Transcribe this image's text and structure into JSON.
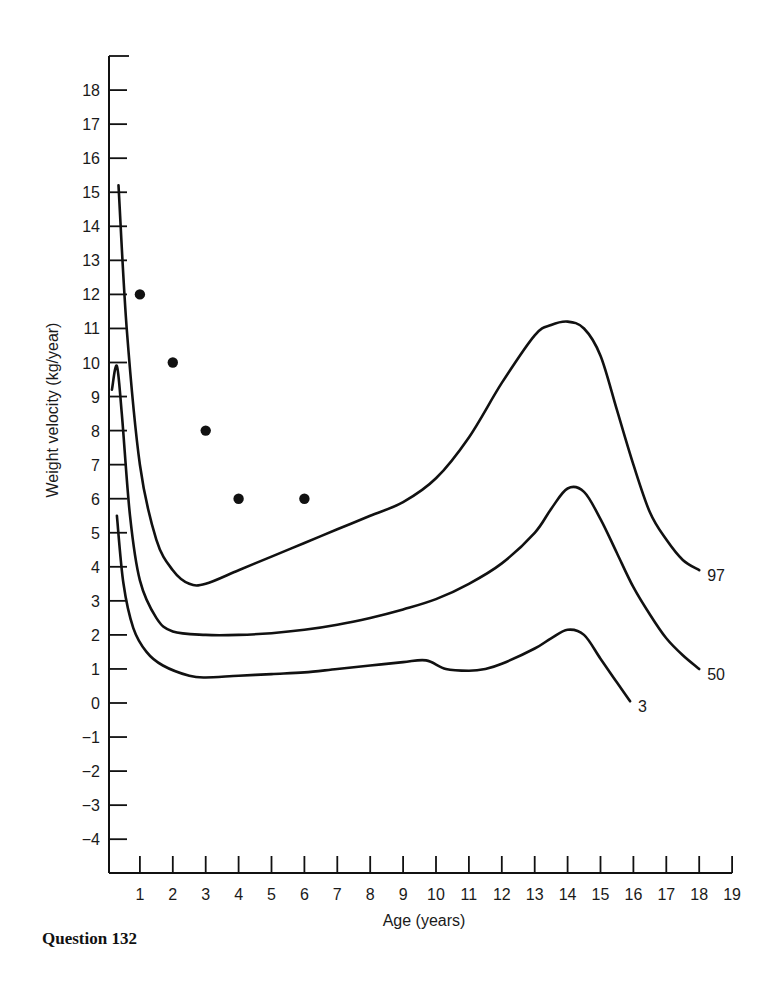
{
  "caption": "Question 132",
  "chart_data": {
    "type": "line",
    "title": "",
    "xlabel": "Age (years)",
    "ylabel": "Weight velocity (kg/year)",
    "xlim": [
      0,
      19
    ],
    "ylim": [
      -5,
      19
    ],
    "x_ticks": [
      1,
      2,
      3,
      4,
      5,
      6,
      7,
      8,
      9,
      10,
      11,
      12,
      13,
      14,
      15,
      16,
      17,
      18,
      19
    ],
    "y_ticks": [
      18,
      17,
      16,
      15,
      14,
      13,
      12,
      11,
      10,
      9,
      8,
      7,
      6,
      5,
      4,
      3,
      2,
      1,
      0,
      -1,
      -2,
      -3,
      -4
    ],
    "grid": false,
    "legend": "inline curve-end labels",
    "series": [
      {
        "name": "97",
        "label": "97",
        "x": [
          0.35,
          0.6,
          1.0,
          1.5,
          2.0,
          2.5,
          3.0,
          4.0,
          5.0,
          6.0,
          7.0,
          8.0,
          9.0,
          10.0,
          11.0,
          12.0,
          13.0,
          13.5,
          14.0,
          14.5,
          15.0,
          15.5,
          16.0,
          16.5,
          17.0,
          17.5,
          18.0
        ],
        "y": [
          15.2,
          11.0,
          7.0,
          4.8,
          3.9,
          3.5,
          3.5,
          3.9,
          4.3,
          4.7,
          5.1,
          5.5,
          5.9,
          6.6,
          7.8,
          9.4,
          10.8,
          11.1,
          11.2,
          11.0,
          10.2,
          8.6,
          7.0,
          5.6,
          4.8,
          4.2,
          3.9
        ]
      },
      {
        "name": "50",
        "label": "50",
        "x": [
          0.15,
          0.3,
          0.45,
          0.7,
          1.0,
          1.5,
          2.0,
          3.0,
          4.0,
          5.0,
          6.0,
          7.0,
          8.0,
          9.0,
          10.0,
          11.0,
          12.0,
          13.0,
          13.5,
          14.0,
          14.5,
          15.0,
          15.5,
          16.0,
          16.5,
          17.0,
          17.5,
          18.0
        ],
        "y": [
          9.2,
          9.9,
          8.5,
          5.5,
          3.6,
          2.5,
          2.1,
          2.0,
          2.0,
          2.05,
          2.15,
          2.3,
          2.5,
          2.75,
          3.05,
          3.5,
          4.1,
          5.0,
          5.7,
          6.3,
          6.2,
          5.4,
          4.4,
          3.4,
          2.6,
          1.9,
          1.4,
          1.0
        ]
      },
      {
        "name": "3",
        "label": "3",
        "x": [
          0.3,
          0.5,
          0.8,
          1.2,
          1.7,
          2.5,
          3.0,
          4.0,
          5.0,
          6.0,
          7.0,
          8.0,
          9.0,
          9.7,
          10.3,
          11.0,
          11.5,
          12.0,
          13.0,
          13.5,
          14.0,
          14.5,
          15.0,
          15.5,
          15.9
        ],
        "y": [
          5.5,
          3.5,
          2.2,
          1.5,
          1.1,
          0.8,
          0.75,
          0.8,
          0.85,
          0.9,
          1.0,
          1.1,
          1.2,
          1.25,
          1.0,
          0.95,
          1.0,
          1.15,
          1.6,
          1.9,
          2.15,
          2.0,
          1.3,
          0.6,
          0.05
        ]
      }
    ],
    "points": {
      "name": "Patient measurements",
      "x": [
        1,
        2,
        3,
        4,
        6
      ],
      "y": [
        12,
        10,
        8,
        6,
        6
      ]
    }
  }
}
